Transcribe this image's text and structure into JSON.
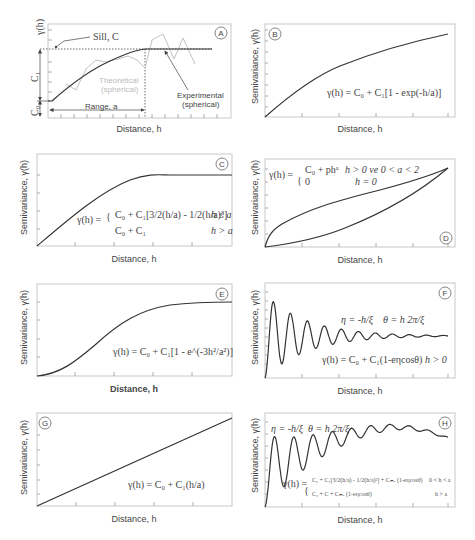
{
  "figure": {
    "x_label": "Distance, h",
    "y_label": "Semivariance, γ(h)"
  },
  "panels": {
    "A": {
      "badge": "A",
      "y_label": "γ(h)",
      "x_label": "Distance, h",
      "sill_label": "Sill, C",
      "c1_label": "C₁",
      "c0_label": "C₀",
      "range_label": "Range, a",
      "theoretical_label_1": "Theoretical",
      "theoretical_label_2": "(spherical)",
      "experimental_label_1": "Experimental",
      "experimental_label_2": "(spherical)"
    },
    "B": {
      "badge": "B",
      "x_label": "Distance, h",
      "y_label": "Semivariance, γ(h)",
      "equation": "γ(h) = C₀ + C₁[1 - exp(-h/a)]"
    },
    "C": {
      "badge": "C",
      "x_label": "Distance, h",
      "y_label": "Semivariance, γ(h)",
      "eq_lhs": "γ(h) =",
      "eq_line1": "C₀ + C₁[3/2(h/a) - 1/2(h/a)³]",
      "eq_cond1": "h ≤ a",
      "eq_line2": "C₀ + C₁",
      "eq_cond2": "h > a"
    },
    "D": {
      "badge": "D",
      "x_label": "Distance, h",
      "y_label": "Semivariance, γ(h)",
      "eq_lhs": "γ(h) =",
      "eq_line1": "C₀ + phᵃ",
      "eq_cond1": "h > 0 ve 0 < a < 2",
      "eq_line2": "0",
      "eq_cond2": "h = 0"
    },
    "E": {
      "badge": "E",
      "x_label": "Distance, h",
      "y_label": "Semivariance, γ(h)",
      "equation": "γ(h) = C₀ + C₁[1 - e^(-3h²/a²)]"
    },
    "F": {
      "badge": "F",
      "x_label": "Distance, h",
      "y_label": "Semivariance, γ(h)",
      "eq_eta": "η = -h/ξ",
      "eq_theta": "θ = h 2π/ξ",
      "equation": "γ(h) = C₀ + C₁(1-eηcosθ)",
      "eq_cond": "h > 0"
    },
    "G": {
      "badge": "G",
      "x_label": "Distance, h",
      "y_label": "Semivariance, γ(h)",
      "equation": "γ(h) = C₀ + C₁(h/a)"
    },
    "H": {
      "badge": "H",
      "x_label": "Distance, h",
      "y_label": "Semivariance, γ(h)",
      "eq_eta": "η = -h/ξ",
      "eq_theta": "θ = h 2π/ξ",
      "eq_lhs": "γ(h) =",
      "eq_line1": "C₀ + C₁[3/2(h/a) - 1/2(h/a)³] + Cₘₐ (1-eηcosθ)",
      "eq_cond1": "0 < h < a",
      "eq_line2": "C₀ + C + Cₘₐ (1-eηcosθ)",
      "eq_cond2": "h > a"
    }
  },
  "chart_data": [
    {
      "panel": "A",
      "type": "line",
      "title": "",
      "xlabel": "Distance, h",
      "ylabel": "γ(h)",
      "series": [
        {
          "name": "Theoretical (spherical)",
          "x": [
            0,
            0.1,
            0.2,
            0.3,
            0.4,
            0.5,
            0.6,
            0.7,
            0.8,
            0.9,
            1.0
          ],
          "y": [
            0.18,
            0.33,
            0.47,
            0.59,
            0.69,
            0.78,
            0.86,
            0.92,
            0.96,
            0.99,
            1.0
          ]
        },
        {
          "name": "Sill plateau",
          "x": [
            1.0,
            1.2,
            1.4,
            1.6,
            1.7
          ],
          "y": [
            1.0,
            1.0,
            1.0,
            1.0,
            1.0
          ]
        },
        {
          "name": "Experimental",
          "x": [
            0.17,
            0.3,
            0.4,
            0.53,
            0.63,
            0.74,
            0.86,
            0.93,
            1.0,
            1.07,
            1.17,
            1.28,
            1.38,
            1.48,
            1.6
          ],
          "y": [
            0.38,
            0.4,
            0.34,
            0.6,
            0.76,
            0.75,
            0.82,
            0.84,
            0.8,
            0.78,
            1.15,
            1.22,
            0.82,
            1.2,
            0.7
          ]
        }
      ],
      "annotations": [
        "Sill, C",
        "C1",
        "C0",
        "Range, a",
        "Theoretical (spherical)",
        "Experimental (spherical)"
      ]
    },
    {
      "panel": "B",
      "type": "line",
      "model": "exponential",
      "equation": "γ(h) = C0 + C1[1 - exp(-h/a)]",
      "x": [
        0,
        0.1,
        0.2,
        0.3,
        0.4,
        0.5,
        0.6,
        0.7,
        0.8,
        0.9,
        1.0
      ],
      "y": [
        0,
        0.2,
        0.36,
        0.5,
        0.6,
        0.69,
        0.76,
        0.81,
        0.86,
        0.9,
        0.93
      ]
    },
    {
      "panel": "C",
      "type": "line",
      "model": "spherical",
      "x": [
        0,
        0.1,
        0.2,
        0.3,
        0.4,
        0.5,
        0.6,
        0.65,
        0.7,
        0.8,
        0.9,
        1.0
      ],
      "y": [
        0,
        0.22,
        0.43,
        0.61,
        0.75,
        0.86,
        0.93,
        0.95,
        0.95,
        0.95,
        0.95,
        0.95
      ]
    },
    {
      "panel": "D",
      "type": "line",
      "model": "power",
      "series": [
        {
          "name": "a < 1",
          "x": [
            0,
            0.02,
            0.05,
            0.1,
            0.2,
            0.3,
            0.5,
            0.7,
            0.9,
            1.0
          ],
          "y": [
            0,
            0.18,
            0.27,
            0.33,
            0.44,
            0.52,
            0.64,
            0.75,
            0.85,
            0.9
          ]
        },
        {
          "name": "a > 1",
          "x": [
            0,
            0.1,
            0.2,
            0.3,
            0.4,
            0.5,
            0.6,
            0.7,
            0.8,
            0.9,
            1.0
          ],
          "y": [
            0,
            0.03,
            0.08,
            0.14,
            0.21,
            0.3,
            0.4,
            0.51,
            0.63,
            0.76,
            0.9
          ]
        }
      ]
    },
    {
      "panel": "E",
      "type": "line",
      "model": "gaussian",
      "x": [
        0,
        0.1,
        0.2,
        0.3,
        0.4,
        0.5,
        0.6,
        0.7,
        0.8,
        0.9,
        1.0
      ],
      "y": [
        0,
        0.04,
        0.15,
        0.32,
        0.52,
        0.68,
        0.8,
        0.87,
        0.91,
        0.93,
        0.94
      ]
    },
    {
      "panel": "F",
      "type": "line",
      "model": "hole-effect (damped cosine)",
      "description": "damped oscillation around sill, decaying amplitude, ~11 peaks"
    },
    {
      "panel": "G",
      "type": "line",
      "model": "linear",
      "x": [
        0,
        1.0
      ],
      "y": [
        0,
        0.94
      ]
    },
    {
      "panel": "H",
      "type": "line",
      "model": "spherical + hole-effect",
      "description": "oscillation superimposed on spherical rise, decaying at far range"
    }
  ]
}
